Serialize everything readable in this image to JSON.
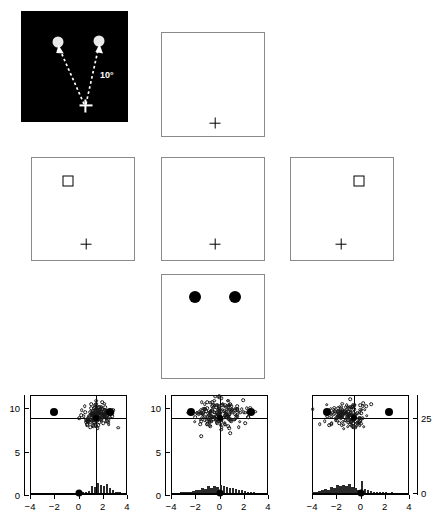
{
  "figure": {
    "type": "experimental-paradigm-with-scatter-histograms",
    "panels": {
      "stimulus_dark": {
        "name": "saccade-target-display",
        "background_color": "#000000",
        "angle_label": "10°",
        "fixation_symbol": "+",
        "targets": [
          {
            "label": "left-disc",
            "color": "#e9e9e9"
          },
          {
            "label": "right-disc",
            "color": "#e9e9e9"
          }
        ],
        "arrows": 2,
        "arrow_style": "dashed"
      },
      "fixation_top": {
        "name": "fixation-only-display",
        "fixation_symbol": "+"
      },
      "cue_left": {
        "name": "cue-left-display",
        "fixation_symbol": "+",
        "square_position": "upper-left"
      },
      "cue_center": {
        "name": "no-cue-display",
        "fixation_symbol": "+",
        "square_position": "none"
      },
      "cue_right": {
        "name": "cue-right-display",
        "fixation_symbol": "+",
        "square_position": "upper-right"
      },
      "targets_bottom": {
        "name": "two-target-display",
        "dot_count": 2,
        "dot_color": "#000000"
      }
    },
    "plots": [
      {
        "name": "plot-left",
        "condition": "cue-left",
        "y_left_labels": [
          "10",
          "5",
          "0"
        ],
        "y_right_labels": [],
        "x_labels": [
          "−4",
          "−2",
          "0",
          "2",
          "4"
        ]
      },
      {
        "name": "plot-center",
        "condition": "no-cue",
        "y_left_labels": [
          "10",
          "5",
          "0"
        ],
        "y_right_labels": [],
        "x_labels": [
          "−4",
          "−2",
          "0",
          "2",
          "4"
        ]
      },
      {
        "name": "plot-right",
        "condition": "cue-right",
        "y_left_labels": [],
        "y_right_labels": [
          "25",
          "0"
        ],
        "x_labels": [
          "−4",
          "−2",
          "0",
          "2",
          "4"
        ]
      }
    ]
  },
  "chart_data": [
    {
      "type": "scatter",
      "name": "plot-left",
      "title": "",
      "xlabel": "",
      "ylabel": "",
      "xlim": [
        -4,
        4
      ],
      "ylim": [
        0,
        11.5
      ],
      "xticks": [
        -4,
        -2,
        0,
        2,
        4
      ],
      "xticklabels": [
        "−4",
        "−2",
        "0",
        "2",
        "4"
      ],
      "yticks": [
        0,
        5,
        10
      ],
      "yticklabels": [
        "0",
        "5",
        "10"
      ],
      "grid": false,
      "legend": "none",
      "reference_lines": {
        "vertical_x": 1.45,
        "horizontal_y": 8.85,
        "baseline_y": 0.25
      },
      "markers": [
        {
          "label": "left-target",
          "x": -2.05,
          "y": 9.5,
          "style": "filled-circle",
          "size": 8
        },
        {
          "label": "right-target",
          "x": 2.6,
          "y": 9.5,
          "style": "filled-circle",
          "size": 8
        },
        {
          "label": "mean-landing",
          "x": 1.45,
          "y": 8.85,
          "style": "filled-circle",
          "size": 6
        },
        {
          "label": "baseline-origin",
          "x": 0.0,
          "y": 0.25,
          "style": "filled-circle",
          "size": 7
        }
      ],
      "scatter_points": {
        "count": 150,
        "center_x": 1.5,
        "center_y": 9.1,
        "spread_x": 0.62,
        "spread_y": 0.72,
        "marker": "open-circle"
      },
      "histogram": {
        "bin_edges": [
          -4.0,
          -3.75,
          -3.5,
          -3.25,
          -3.0,
          -2.75,
          -2.5,
          -2.25,
          -2.0,
          -1.75,
          -1.5,
          -1.25,
          -1.0,
          -0.75,
          -0.5,
          -0.25,
          0.0,
          0.25,
          0.5,
          0.75,
          1.0,
          1.25,
          1.5,
          1.75,
          2.0,
          2.25,
          2.5,
          2.75,
          3.0,
          3.25,
          3.5,
          3.75,
          4.0
        ],
        "counts": [
          0,
          0,
          0,
          0,
          0,
          0,
          0,
          0,
          0,
          0,
          0,
          0,
          0,
          0,
          0,
          0,
          1,
          1,
          2,
          3,
          10,
          9,
          16,
          13,
          11,
          14,
          7,
          5,
          2,
          1,
          0,
          0
        ],
        "max_count": 25
      }
    },
    {
      "type": "scatter",
      "name": "plot-center",
      "title": "",
      "xlabel": "",
      "ylabel": "",
      "xlim": [
        -4,
        4
      ],
      "ylim": [
        0,
        11.5
      ],
      "xticks": [
        -4,
        -2,
        0,
        2,
        4
      ],
      "xticklabels": [
        "−4",
        "−2",
        "0",
        "2",
        "4"
      ],
      "yticks": [
        0,
        5,
        10
      ],
      "yticklabels": [
        "0",
        "5",
        "10"
      ],
      "grid": false,
      "legend": "none",
      "reference_lines": {
        "vertical_x": 0.0,
        "horizontal_y": 8.85,
        "baseline_y": 0.25
      },
      "markers": [
        {
          "label": "left-target",
          "x": -2.35,
          "y": 9.5,
          "style": "filled-circle",
          "size": 8
        },
        {
          "label": "right-target",
          "x": 2.6,
          "y": 9.5,
          "style": "filled-circle",
          "size": 8
        },
        {
          "label": "mean-landing",
          "x": 0.0,
          "y": 8.85,
          "style": "filled-circle",
          "size": 6
        },
        {
          "label": "baseline-origin",
          "x": 0.0,
          "y": 0.25,
          "style": "filled-circle",
          "size": 7
        }
      ],
      "scatter_points": {
        "count": 190,
        "center_x": 0.0,
        "center_y": 9.3,
        "spread_x": 1.05,
        "spread_y": 0.78,
        "marker": "open-circle"
      },
      "histogram": {
        "bin_edges": [
          -4.0,
          -3.75,
          -3.5,
          -3.25,
          -3.0,
          -2.75,
          -2.5,
          -2.25,
          -2.0,
          -1.75,
          -1.5,
          -1.25,
          -1.0,
          -0.75,
          -0.5,
          -0.25,
          0.0,
          0.25,
          0.5,
          0.75,
          1.0,
          1.25,
          1.5,
          1.75,
          2.0,
          2.25,
          2.5,
          2.75,
          3.0,
          3.25,
          3.5,
          3.75,
          4.0
        ],
        "counts": [
          0,
          0,
          0,
          1,
          1,
          2,
          2,
          3,
          5,
          4,
          7,
          6,
          10,
          7,
          11,
          9,
          12,
          10,
          9,
          8,
          7,
          6,
          5,
          4,
          3,
          2,
          1,
          1,
          0,
          0,
          0,
          0
        ],
        "max_count": 25
      }
    },
    {
      "type": "scatter",
      "name": "plot-right",
      "title": "",
      "xlabel": "",
      "ylabel": "",
      "xlim": [
        -4,
        4
      ],
      "ylim": [
        0,
        11.5
      ],
      "xticks": [
        -4,
        -2,
        0,
        2,
        4
      ],
      "xticklabels": [
        "−4",
        "−2",
        "0",
        "2",
        "4"
      ],
      "yticks_right": [
        0,
        25
      ],
      "yticklabels_right": [
        "0",
        "25"
      ],
      "grid": false,
      "legend": "none",
      "reference_lines": {
        "vertical_x": -0.5,
        "horizontal_y": 8.85,
        "baseline_y": 0.25
      },
      "markers": [
        {
          "label": "left-target",
          "x": -2.8,
          "y": 9.5,
          "style": "filled-circle",
          "size": 8
        },
        {
          "label": "right-target",
          "x": 2.35,
          "y": 9.5,
          "style": "filled-circle",
          "size": 8
        },
        {
          "label": "mean-landing",
          "x": -0.5,
          "y": 8.85,
          "style": "filled-circle",
          "size": 6
        },
        {
          "label": "baseline-origin",
          "x": 0.0,
          "y": 0.25,
          "style": "filled-circle",
          "size": 7
        }
      ],
      "scatter_points": {
        "count": 150,
        "center_x": -1.1,
        "center_y": 9.3,
        "spread_x": 0.8,
        "spread_y": 0.75,
        "marker": "open-circle"
      },
      "histogram": {
        "bin_edges": [
          -4.0,
          -3.75,
          -3.5,
          -3.25,
          -3.0,
          -2.75,
          -2.5,
          -2.25,
          -2.0,
          -1.75,
          -1.5,
          -1.25,
          -1.0,
          -0.75,
          -0.5,
          -0.25,
          0.0,
          0.25,
          0.5,
          0.75,
          1.0,
          1.25,
          1.5,
          1.75,
          2.0,
          2.25,
          2.5,
          2.75,
          3.0,
          3.25,
          3.5,
          3.75,
          4.0
        ],
        "counts": [
          1,
          2,
          3,
          4,
          6,
          5,
          9,
          8,
          12,
          10,
          13,
          11,
          14,
          9,
          7,
          5,
          18,
          6,
          4,
          3,
          2,
          2,
          1,
          1,
          1,
          0,
          1,
          0,
          0,
          0,
          0,
          0
        ],
        "max_count": 25
      }
    }
  ]
}
